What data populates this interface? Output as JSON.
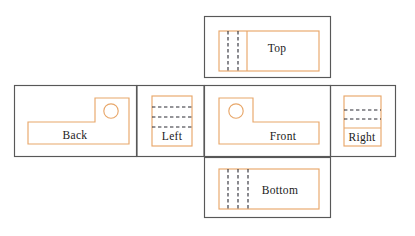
{
  "diagram": {
    "kind": "engineering-drawing",
    "canvas": {
      "width": 415,
      "height": 236,
      "background": "#ffffff"
    },
    "colors": {
      "part_outline": "#e8a76a",
      "hidden_edge": "#2a2a33",
      "cell_frame": "#585858",
      "label_text": "#1a1a1a",
      "background": "#ffffff"
    },
    "line_styles": {
      "visible_edge": "solid",
      "hidden_edge": "dashed",
      "frame": "solid"
    }
  },
  "views": {
    "top": {
      "label": "Top",
      "label_x": 277,
      "label_y": 48,
      "frame": {
        "x": 204,
        "y": 16,
        "w": 127,
        "h": 62
      },
      "outline": {
        "x": 219,
        "y": 31,
        "w": 100,
        "h": 40
      },
      "solid_divider_x": 247,
      "hidden_lines_x": [
        228,
        238
      ],
      "hidden_line_count": 2,
      "hidden_orientation": "vertical"
    },
    "back": {
      "label": "Back",
      "label_x": 75,
      "label_y": 135,
      "frame": {
        "x": 14,
        "y": 85,
        "w": 123,
        "h": 72
      },
      "hole": {
        "cx": 111,
        "cy": 111,
        "r": 7.2
      },
      "shape": "L-profile-raised-right",
      "hidden_line_count": 0
    },
    "left": {
      "label": "Left",
      "label_x": 172,
      "label_y": 136,
      "frame": {
        "x": 137,
        "y": 85,
        "w": 67,
        "h": 72
      },
      "outline": {
        "x": 152,
        "y": 96,
        "w": 40,
        "h": 50
      },
      "hidden_lines_y": [
        107,
        117,
        127
      ],
      "hidden_line_count": 3,
      "hidden_orientation": "horizontal"
    },
    "front": {
      "label": "Front",
      "label_x": 283,
      "label_y": 136,
      "frame": {
        "x": 204,
        "y": 85,
        "w": 126,
        "h": 72
      },
      "hole": {
        "cx": 236,
        "cy": 111,
        "r": 7.2
      },
      "shape": "L-profile-raised-left",
      "hidden_line_count": 0
    },
    "right": {
      "label": "Right",
      "label_x": 362,
      "label_y": 136,
      "frame": {
        "x": 330,
        "y": 85,
        "w": 66,
        "h": 72
      },
      "outline": {
        "x": 344,
        "y": 96,
        "w": 37,
        "h": 50
      },
      "hidden_lines_y": [
        110,
        119
      ],
      "solid_divider_y": 128,
      "hidden_line_count": 2,
      "hidden_orientation": "horizontal"
    },
    "bottom": {
      "label": "Bottom",
      "label_x": 280,
      "label_y": 190,
      "frame": {
        "x": 204,
        "y": 158,
        "w": 127,
        "h": 60
      },
      "outline": {
        "x": 219,
        "y": 169,
        "w": 100,
        "h": 40
      },
      "hidden_lines_x": [
        228,
        238,
        248
      ],
      "hidden_line_count": 3,
      "hidden_orientation": "vertical"
    }
  },
  "labels_order": [
    "Top",
    "Back",
    "Left",
    "Front",
    "Right",
    "Bottom"
  ]
}
